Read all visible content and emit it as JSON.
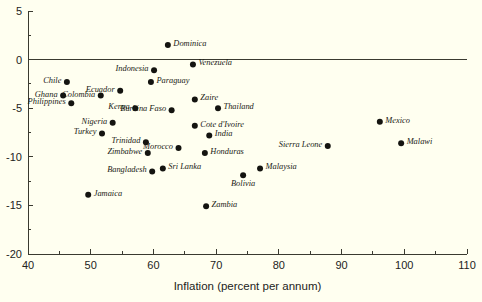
{
  "chart_data": {
    "type": "scatter",
    "title": "",
    "xlabel": "Inflation (percent per annum)",
    "ylabel": "",
    "xlim": [
      40,
      110
    ],
    "ylim": [
      -20,
      5
    ],
    "grid": false,
    "legend": "none",
    "x_ticks": [
      40,
      50,
      60,
      70,
      80,
      90,
      100,
      110
    ],
    "x_tick_labels": [
      "40",
      "50",
      "60",
      "70",
      "80",
      "90",
      "100",
      "110"
    ],
    "x_minor_ticks": [
      45,
      55,
      65,
      75,
      85,
      95,
      105
    ],
    "y_ticks": [
      5,
      0,
      -5,
      -10,
      -15,
      -20
    ],
    "y_tick_labels": [
      "5",
      "0",
      "-5",
      "-10",
      "-15",
      "-20"
    ],
    "y_minor_ticks": [
      2.5,
      -2.5,
      -7.5,
      -12.5,
      -17.5
    ],
    "zero_reference_line": 0,
    "points": [
      {
        "label": "Dominica",
        "x": 62.3,
        "y": 1.5,
        "label_side": "right"
      },
      {
        "label": "Venezuela",
        "x": 66.3,
        "y": -0.5,
        "label_side": "right"
      },
      {
        "label": "Indonesia",
        "x": 60.1,
        "y": -1.1,
        "label_side": "left"
      },
      {
        "label": "Chile",
        "x": 46.2,
        "y": -2.3,
        "label_side": "left"
      },
      {
        "label": "Paraguay",
        "x": 59.6,
        "y": -2.3,
        "label_side": "right"
      },
      {
        "label": "Ecuador",
        "x": 54.7,
        "y": -3.2,
        "label_side": "left"
      },
      {
        "label": "Ghana",
        "x": 45.6,
        "y": -3.7,
        "label_side": "left"
      },
      {
        "label": "Colombia",
        "x": 51.6,
        "y": -3.7,
        "label_side": "left"
      },
      {
        "label": "Zaire",
        "x": 66.6,
        "y": -4.1,
        "label_side": "right"
      },
      {
        "label": "Philippines",
        "x": 46.9,
        "y": -4.5,
        "label_side": "left"
      },
      {
        "label": "Kenya",
        "x": 57.1,
        "y": -5.0,
        "label_side": "left"
      },
      {
        "label": "Thailand",
        "x": 70.3,
        "y": -5.0,
        "label_side": "right"
      },
      {
        "label": "Burkina Faso",
        "x": 62.9,
        "y": -5.2,
        "label_side": "left"
      },
      {
        "label": "Nigeria",
        "x": 53.5,
        "y": -6.5,
        "label_side": "left"
      },
      {
        "label": "Mexico",
        "x": 96.1,
        "y": -6.4,
        "label_side": "right"
      },
      {
        "label": "Cote d'Ivoire",
        "x": 66.6,
        "y": -6.8,
        "label_side": "right"
      },
      {
        "label": "Turkey",
        "x": 51.8,
        "y": -7.6,
        "label_side": "left"
      },
      {
        "label": "India",
        "x": 68.9,
        "y": -7.8,
        "label_side": "right"
      },
      {
        "label": "Trinidad",
        "x": 58.8,
        "y": -8.5,
        "label_side": "left"
      },
      {
        "label": "Malawi",
        "x": 99.5,
        "y": -8.6,
        "label_side": "right"
      },
      {
        "label": "Sierra Leone",
        "x": 87.8,
        "y": -8.9,
        "label_side": "left"
      },
      {
        "label": "Morocco",
        "x": 64.0,
        "y": -9.1,
        "label_side": "left"
      },
      {
        "label": "Zimbabwe",
        "x": 59.1,
        "y": -9.6,
        "label_side": "left"
      },
      {
        "label": "Honduras",
        "x": 68.2,
        "y": -9.6,
        "label_side": "right"
      },
      {
        "label": "Sri Lanka",
        "x": 61.5,
        "y": -11.2,
        "label_side": "right"
      },
      {
        "label": "Malaysia",
        "x": 77.0,
        "y": -11.2,
        "label_side": "right"
      },
      {
        "label": "Bangladesh",
        "x": 59.8,
        "y": -11.5,
        "label_side": "left"
      },
      {
        "label": "Bolivia",
        "x": 74.3,
        "y": -11.9,
        "label_side": "below"
      },
      {
        "label": "Jamaica",
        "x": 49.6,
        "y": -13.9,
        "label_side": "right"
      },
      {
        "label": "Zambia",
        "x": 68.4,
        "y": -15.1,
        "label_side": "right"
      }
    ]
  },
  "colors": {
    "background": "#fffff0",
    "axis": "#3a3a30",
    "marker": "#141410",
    "text": "#23231c"
  }
}
